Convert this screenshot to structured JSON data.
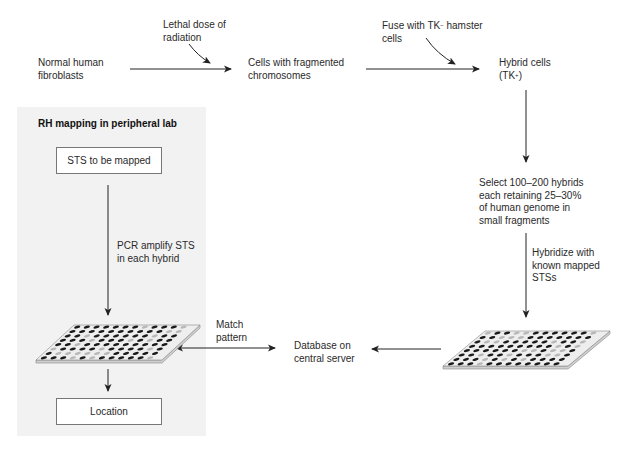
{
  "diagram": {
    "top_row": {
      "normal_cells": [
        "Normal human",
        "fibroblasts"
      ],
      "radiation_note": [
        "Lethal dose of",
        "radiation"
      ],
      "fragmented_cells": [
        "Cells with fragmented",
        "chromosomes"
      ],
      "fuse_note_pre": "Fuse with TK",
      "fuse_note_sup": "−",
      "fuse_note_post": " hamster",
      "fuse_note_line2": "cells",
      "hybrid_cells_line1": "Hybrid cells",
      "hybrid_cells_pre": "(TK",
      "hybrid_cells_sup": "+",
      "hybrid_cells_post": ")"
    },
    "right_column": {
      "select_hybrids": [
        "Select 100–200 hybrids",
        "each retaining 25–30%",
        "of human genome in",
        "small fragments"
      ],
      "hybridize_note": [
        "Hybridize with",
        "known mapped",
        "STSs"
      ]
    },
    "center": {
      "database": [
        "Database on",
        "central server"
      ],
      "match_pattern": [
        "Match",
        "pattern"
      ]
    },
    "peripheral_lab": {
      "title": "RH mapping in peripheral lab",
      "sts_box": "STS to be mapped",
      "pcr_note": [
        "PCR amplify STS",
        "in each hybrid"
      ],
      "location_box": "Location"
    },
    "colors": {
      "panel_bg": "#f2f2f2",
      "arrow": "#222222",
      "well_dark": "#1a1a1a",
      "well_light": "#b8b8b8",
      "plate": "#eeeeee"
    }
  }
}
